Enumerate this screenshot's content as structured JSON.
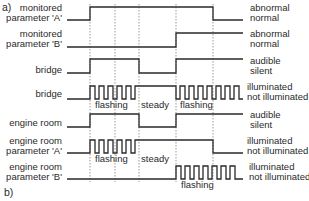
{
  "figure": {
    "part_a_label": "a)",
    "part_b_label": "b)"
  },
  "rows": [
    {
      "left": [
        "monitored",
        "parameter 'A'"
      ],
      "right": [
        "abnormal",
        "normal"
      ]
    },
    {
      "left": [
        "monitored",
        "parameter 'B'"
      ],
      "right": [
        "abnormal",
        "normal"
      ]
    },
    {
      "left": [
        "bridge"
      ],
      "right": [
        "audible",
        "silent"
      ]
    },
    {
      "left": [
        "bridge"
      ],
      "right": [
        "illuminated",
        "not illuminated"
      ]
    },
    {
      "left": [
        "engine room"
      ],
      "right": [
        "audible",
        "silent"
      ]
    },
    {
      "left": [
        "engine room",
        "parameter 'A'"
      ],
      "right": [
        "illuminated",
        "not illuminated"
      ]
    },
    {
      "left": [
        "engine room",
        "parameter 'B'"
      ],
      "right": [
        "illuminated",
        "not illuminated"
      ]
    }
  ],
  "segment_labels": {
    "bridge_flashing_1": "flashing",
    "bridge_steady": "steady",
    "bridge_flashing_2": "flashing",
    "er_a_flashing": "flashing",
    "er_a_steady": "steady",
    "er_b_flashing": "flashing"
  },
  "colors": {
    "line": "#2a2a2a",
    "guide": "#555555",
    "background": "#ffffff"
  }
}
